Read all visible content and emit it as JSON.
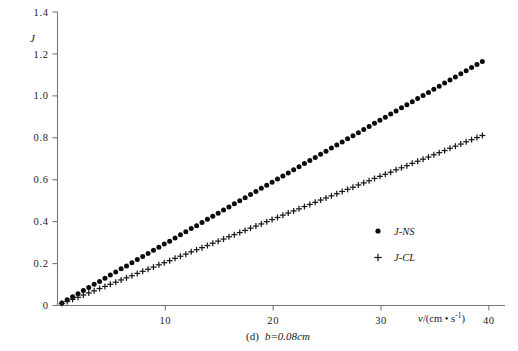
{
  "figure": {
    "caption_prefix": "(d)",
    "caption_body": "b=0.08cm",
    "caption_full": "(d)  b=0.08cm"
  },
  "axes": {
    "y_title": "J",
    "x_title_var": "v",
    "x_title_unit": "/(cm • s",
    "x_title_exp": "-1",
    "x_title_close": ")",
    "x_title_full": "v/(cm • s⁻¹)"
  },
  "legend": {
    "entries": [
      {
        "label": "J-NS",
        "marker": "filled-circle-marker",
        "color": "#0b0b0b"
      },
      {
        "label": "J-CL",
        "marker": "plus-marker",
        "color": "#1a1a1a"
      }
    ]
  },
  "chart_data": {
    "type": "scatter",
    "xlabel": "v/(cm • s⁻¹)",
    "ylabel": "J",
    "xlim": [
      0,
      41.5
    ],
    "ylim": [
      0,
      1.4
    ],
    "xticks": [
      10,
      20,
      30,
      40
    ],
    "yticks": [
      0,
      0.2,
      0.4,
      0.6,
      0.8,
      1.0,
      1.2,
      1.4
    ],
    "ytick_labels": [
      "0",
      "0.2",
      "0.4",
      "0.6",
      "0.8",
      "1.0",
      "1.2",
      "1.4"
    ],
    "xtick_labels": [
      "10",
      "20",
      "30",
      "40"
    ],
    "grid": false,
    "legend_position": "center-right",
    "series": [
      {
        "name": "J-NS",
        "marker": "circle",
        "color": "#0b0b0b",
        "x": [
          0.4,
          0.9,
          1.4,
          1.9,
          2.4,
          2.9,
          3.4,
          3.9,
          4.4,
          4.9,
          5.4,
          5.9,
          6.4,
          6.9,
          7.4,
          7.9,
          8.4,
          8.9,
          9.4,
          9.9,
          10.4,
          10.9,
          11.4,
          11.9,
          12.4,
          12.9,
          13.4,
          13.9,
          14.4,
          14.9,
          15.4,
          15.9,
          16.4,
          16.9,
          17.4,
          17.9,
          18.4,
          18.9,
          19.4,
          19.9,
          20.4,
          20.9,
          21.4,
          21.9,
          22.4,
          22.9,
          23.4,
          23.9,
          24.4,
          24.9,
          25.4,
          25.9,
          26.4,
          26.9,
          27.4,
          27.9,
          28.4,
          28.9,
          29.4,
          29.9,
          30.4,
          30.9,
          31.4,
          31.9,
          32.4,
          32.9,
          33.4,
          33.9,
          34.4,
          34.9,
          35.4,
          35.9,
          36.4,
          36.9,
          37.4,
          37.9,
          38.4,
          38.9,
          39.4
        ],
        "y": [
          0.012,
          0.027,
          0.042,
          0.056,
          0.071,
          0.086,
          0.101,
          0.115,
          0.13,
          0.145,
          0.16,
          0.175,
          0.189,
          0.204,
          0.219,
          0.234,
          0.248,
          0.263,
          0.278,
          0.293,
          0.307,
          0.322,
          0.337,
          0.352,
          0.367,
          0.381,
          0.396,
          0.411,
          0.426,
          0.44,
          0.455,
          0.47,
          0.485,
          0.5,
          0.514,
          0.529,
          0.544,
          0.559,
          0.573,
          0.588,
          0.603,
          0.618,
          0.632,
          0.647,
          0.662,
          0.677,
          0.692,
          0.706,
          0.721,
          0.736,
          0.751,
          0.765,
          0.78,
          0.795,
          0.81,
          0.824,
          0.839,
          0.854,
          0.869,
          0.884,
          0.898,
          0.913,
          0.928,
          0.943,
          0.957,
          0.972,
          0.987,
          1.002,
          1.016,
          1.031,
          1.046,
          1.061,
          1.076,
          1.09,
          1.105,
          1.12,
          1.135,
          1.149,
          1.164
        ]
      },
      {
        "name": "J-CL",
        "marker": "plus",
        "color": "#1a1a1a",
        "x": [
          0.4,
          0.9,
          1.4,
          1.9,
          2.4,
          2.9,
          3.4,
          3.9,
          4.4,
          4.9,
          5.4,
          5.9,
          6.4,
          6.9,
          7.4,
          7.9,
          8.4,
          8.9,
          9.4,
          9.9,
          10.4,
          10.9,
          11.4,
          11.9,
          12.4,
          12.9,
          13.4,
          13.9,
          14.4,
          14.9,
          15.4,
          15.9,
          16.4,
          16.9,
          17.4,
          17.9,
          18.4,
          18.9,
          19.4,
          19.9,
          20.4,
          20.9,
          21.4,
          21.9,
          22.4,
          22.9,
          23.4,
          23.9,
          24.4,
          24.9,
          25.4,
          25.9,
          26.4,
          26.9,
          27.4,
          27.9,
          28.4,
          28.9,
          29.4,
          29.9,
          30.4,
          30.9,
          31.4,
          31.9,
          32.4,
          32.9,
          33.4,
          33.9,
          34.4,
          34.9,
          35.4,
          35.9,
          36.4,
          36.9,
          37.4,
          37.9,
          38.4,
          38.9,
          39.4
        ],
        "y": [
          0.009,
          0.019,
          0.029,
          0.039,
          0.05,
          0.06,
          0.07,
          0.081,
          0.091,
          0.101,
          0.111,
          0.122,
          0.132,
          0.142,
          0.153,
          0.163,
          0.173,
          0.183,
          0.194,
          0.204,
          0.214,
          0.225,
          0.235,
          0.245,
          0.256,
          0.266,
          0.276,
          0.286,
          0.297,
          0.307,
          0.317,
          0.328,
          0.338,
          0.348,
          0.358,
          0.369,
          0.379,
          0.389,
          0.4,
          0.41,
          0.42,
          0.431,
          0.441,
          0.451,
          0.461,
          0.472,
          0.482,
          0.492,
          0.503,
          0.513,
          0.523,
          0.533,
          0.544,
          0.554,
          0.564,
          0.575,
          0.585,
          0.595,
          0.606,
          0.616,
          0.626,
          0.636,
          0.647,
          0.657,
          0.667,
          0.678,
          0.688,
          0.698,
          0.708,
          0.719,
          0.729,
          0.739,
          0.75,
          0.76,
          0.77,
          0.781,
          0.791,
          0.801,
          0.811
        ]
      }
    ]
  }
}
